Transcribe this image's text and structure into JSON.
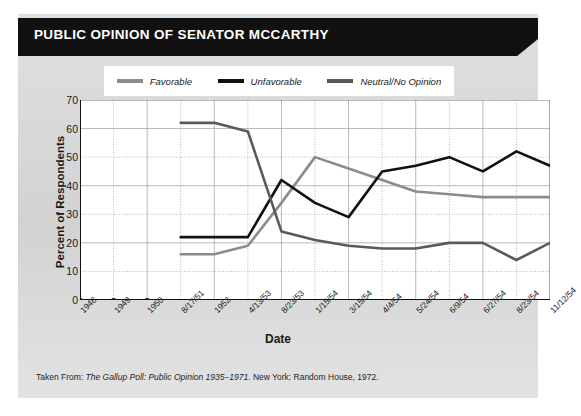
{
  "header": {
    "title": "PUBLIC OPINION OF SENATOR MCCARTHY"
  },
  "footer": {
    "prefix": "Taken From: ",
    "source_italic": "The Gallup Poll: Public Opinion 1935–1971",
    "suffix": ". New York: Random House, 1972."
  },
  "colors": {
    "banner": "#111111",
    "card_background": "#d9d9d9",
    "plot_background": "#ffffff",
    "favorable": "#8c8c8c",
    "unfavorable": "#111111",
    "neutral": "#5a5a5a",
    "grid": "#9a9a9a",
    "axis": "#111111"
  },
  "chart_data": {
    "type": "line",
    "title": "PUBLIC OPINION OF SENATOR MCCARTHY",
    "xlabel": "Date",
    "ylabel": "Percent of Respondents",
    "ylim": [
      0,
      70
    ],
    "yticks": [
      0,
      10,
      20,
      30,
      40,
      50,
      60,
      70
    ],
    "grid": true,
    "legend_position": "top",
    "categories": [
      "1948",
      "1949",
      "1950",
      "8/17/51",
      "1952",
      "4/13/53",
      "8/23/53",
      "1/15/54",
      "3/15/54",
      "4/4/54",
      "5/24/54",
      "6/9/54",
      "6/27/54",
      "8/23/54",
      "11/12/54"
    ],
    "series": [
      {
        "name": "Favorable",
        "color": "#8c8c8c",
        "values": [
          null,
          null,
          null,
          16,
          16,
          19,
          34,
          50,
          46,
          42,
          38,
          37,
          36,
          36,
          36
        ]
      },
      {
        "name": "Unfavorable",
        "color": "#111111",
        "values": [
          null,
          null,
          null,
          22,
          22,
          22,
          42,
          34,
          29,
          45,
          47,
          50,
          45,
          52,
          47
        ]
      },
      {
        "name": "Neutral/No Opinion",
        "color": "#5a5a5a",
        "values": [
          null,
          null,
          null,
          62,
          62,
          59,
          24,
          21,
          19,
          18,
          18,
          20,
          20,
          14,
          20
        ]
      }
    ]
  }
}
